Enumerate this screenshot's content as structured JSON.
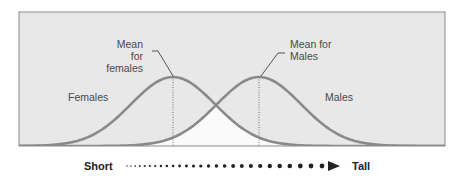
{
  "chart_data": {
    "type": "area",
    "title": "",
    "series": [
      {
        "name": "Females",
        "distribution": "normal",
        "mean_x_px": 173,
        "peak_y_px": 77
      },
      {
        "name": "Males",
        "distribution": "normal",
        "mean_x_px": 259,
        "peak_y_px": 77
      }
    ],
    "annotations": [
      "Mean for females",
      "Mean for Males",
      "Females",
      "Males"
    ],
    "xlabel_left": "Short",
    "xlabel_right": "Tall",
    "grid": false,
    "legend": "none"
  },
  "labels": {
    "mean_female_line1": "Mean for",
    "mean_female_line2": "females",
    "mean_male_line1": "Mean for",
    "mean_male_line2": "Males",
    "females": "Females",
    "males": "Males",
    "axis_short": "Short",
    "axis_tall": "Tall"
  },
  "colors": {
    "panel": "#e8e8e8",
    "overlap": "#fafafa",
    "curve": "#8a8a8a",
    "frame": "#8c8c8c"
  }
}
